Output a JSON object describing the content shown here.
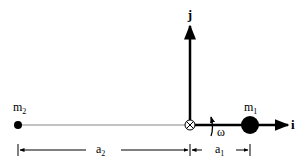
{
  "diagram": {
    "type": "two-mass rotating system",
    "axes": {
      "x_label": "i",
      "y_label": "j"
    },
    "masses": [
      {
        "label": "m",
        "sub": "1",
        "size": "large",
        "side": "right"
      },
      {
        "label": "m",
        "sub": "2",
        "size": "small",
        "side": "left"
      }
    ],
    "angular_velocity": "ω",
    "dimensions": [
      {
        "label": "a",
        "sub": "2",
        "from": "m2",
        "to": "origin"
      },
      {
        "label": "a",
        "sub": "1",
        "from": "origin",
        "to": "m1"
      }
    ],
    "origin_symbol": "⊗",
    "colors": {
      "ink": "#000000",
      "rod": "#888888",
      "background": "#ffffff"
    }
  }
}
